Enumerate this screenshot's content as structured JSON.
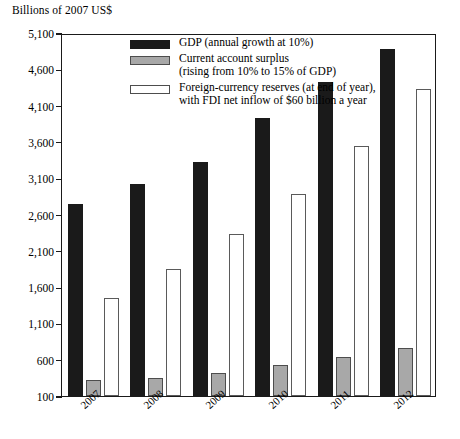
{
  "chart_data": {
    "type": "bar",
    "title": "",
    "ylabel": "Billions of 2007 US$",
    "xlabel": "",
    "categories": [
      "2007",
      "2008",
      "2009",
      "2010",
      "2011",
      "2012"
    ],
    "ylim": [
      100,
      5100
    ],
    "yticks": [
      "100",
      "600",
      "1,100",
      "1,600",
      "2,100",
      "2,600",
      "3,100",
      "3,600",
      "4,100",
      "4,600",
      "5,100"
    ],
    "ytick_values": [
      100,
      600,
      1100,
      1600,
      2100,
      2600,
      3100,
      3600,
      4100,
      4600,
      5100
    ],
    "grid": false,
    "legend_position": "top-right-inside",
    "series": [
      {
        "name": "GDP (annual growth at 10%)",
        "key": "gdp",
        "color": "#1a1a1a",
        "values": [
          2750,
          3025,
          3330,
          3930,
          4425,
          4880
        ]
      },
      {
        "name": "Current account surplus\n(rising from 10% to 15% of GDP)",
        "key": "surplus",
        "color": "#a8a8a8",
        "values": [
          320,
          350,
          420,
          530,
          640,
          760
        ]
      },
      {
        "name": "Foreign-currency reserves (at end of year),\nwith FDI net inflow of $60 billion a year",
        "key": "reserves",
        "color": "#ffffff",
        "values": [
          1450,
          1850,
          2330,
          2880,
          3550,
          4330
        ]
      }
    ]
  },
  "axis": {
    "y_title": "Billions of 2007 US$"
  }
}
